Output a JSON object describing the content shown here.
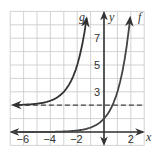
{
  "chart_data": {
    "type": "line",
    "title": "",
    "xlabel": "x",
    "ylabel": "y",
    "xlim": [
      -7,
      3
    ],
    "ylim": [
      -1,
      9
    ],
    "grid": true,
    "x_tick_labels": [
      "−6",
      "−4",
      "−2",
      "2"
    ],
    "x_ticks": [
      -6,
      -4,
      -2,
      2
    ],
    "y_tick_labels": [
      "3",
      "5",
      "7"
    ],
    "y_ticks": [
      3,
      5,
      7
    ],
    "series": [
      {
        "name": "f",
        "label": "f",
        "approx_equation": "y = 3^x",
        "asymptote": 0,
        "points": [
          [
            -6.5,
            0.0
          ],
          [
            -4,
            0.01
          ],
          [
            -2,
            0.11
          ],
          [
            -1,
            0.33
          ],
          [
            0,
            1
          ],
          [
            0.5,
            1.73
          ],
          [
            1,
            3
          ],
          [
            1.5,
            5.2
          ],
          [
            1.95,
            8.5
          ]
        ]
      },
      {
        "name": "g",
        "label": "g",
        "approx_equation": "y = 3^(x+3) + 2",
        "asymptote": 2,
        "points": [
          [
            -6.5,
            2.0
          ],
          [
            -5,
            2.11
          ],
          [
            -4,
            2.33
          ],
          [
            -3,
            3
          ],
          [
            -2.5,
            3.73
          ],
          [
            -2,
            5
          ],
          [
            -1.5,
            7.2
          ],
          [
            -1.3,
            8.5
          ]
        ]
      }
    ],
    "annotations": [
      {
        "type": "dashed_horizontal_line",
        "y": 2
      }
    ],
    "legend": "inline labels near curve ends"
  },
  "labels": {
    "x_axis": "x",
    "y_axis": "y",
    "f": "f",
    "g": "g",
    "xt": [
      "−6",
      "−4",
      "−2",
      "2"
    ],
    "yt": [
      "3",
      "5",
      "7"
    ]
  }
}
